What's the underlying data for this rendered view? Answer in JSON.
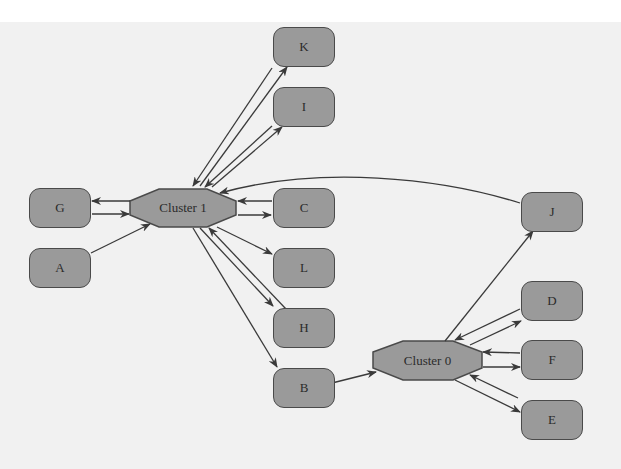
{
  "diagram": {
    "type": "directed-graph",
    "background_color": "#f1f1f1",
    "node_fill": "#9a9a9a",
    "edge_color": "#3a3a3a",
    "clusters": [
      {
        "id": "cluster1",
        "label": "Cluster 1"
      },
      {
        "id": "cluster0",
        "label": "Cluster 0"
      }
    ],
    "nodes": [
      {
        "id": "K",
        "label": "K"
      },
      {
        "id": "I",
        "label": "I"
      },
      {
        "id": "G",
        "label": "G"
      },
      {
        "id": "C",
        "label": "C"
      },
      {
        "id": "A",
        "label": "A"
      },
      {
        "id": "L",
        "label": "L"
      },
      {
        "id": "H",
        "label": "H"
      },
      {
        "id": "B",
        "label": "B"
      },
      {
        "id": "J",
        "label": "J"
      },
      {
        "id": "D",
        "label": "D"
      },
      {
        "id": "F",
        "label": "F"
      },
      {
        "id": "E",
        "label": "E"
      }
    ],
    "edges": [
      {
        "from": "Cluster 1",
        "to": "K"
      },
      {
        "from": "K",
        "to": "Cluster 1"
      },
      {
        "from": "Cluster 1",
        "to": "I"
      },
      {
        "from": "I",
        "to": "Cluster 1"
      },
      {
        "from": "Cluster 1",
        "to": "G"
      },
      {
        "from": "G",
        "to": "Cluster 1"
      },
      {
        "from": "A",
        "to": "Cluster 1"
      },
      {
        "from": "Cluster 1",
        "to": "C"
      },
      {
        "from": "C",
        "to": "Cluster 1"
      },
      {
        "from": "J",
        "to": "Cluster 1"
      },
      {
        "from": "Cluster 1",
        "to": "L"
      },
      {
        "from": "Cluster 1",
        "to": "H"
      },
      {
        "from": "H",
        "to": "Cluster 1"
      },
      {
        "from": "Cluster 1",
        "to": "B"
      },
      {
        "from": "B",
        "to": "Cluster 0"
      },
      {
        "from": "Cluster 0",
        "to": "J"
      },
      {
        "from": "Cluster 0",
        "to": "D"
      },
      {
        "from": "D",
        "to": "Cluster 0"
      },
      {
        "from": "Cluster 0",
        "to": "F"
      },
      {
        "from": "F",
        "to": "Cluster 0"
      },
      {
        "from": "Cluster 0",
        "to": "E"
      },
      {
        "from": "E",
        "to": "Cluster 0"
      }
    ]
  }
}
